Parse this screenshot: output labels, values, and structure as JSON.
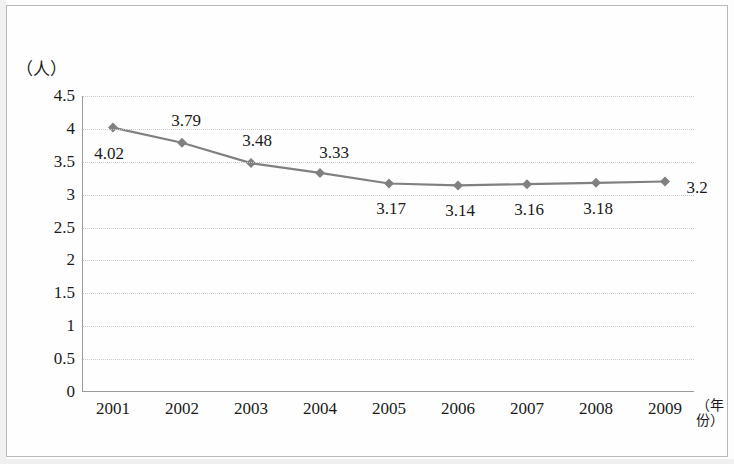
{
  "figure": {
    "unit_label": "（人）",
    "x_axis_title": "（年份）"
  },
  "chart_data": {
    "type": "line",
    "title": "",
    "subtitle": "",
    "xlabel": "（年份）",
    "ylabel": "（人）",
    "categories": [
      "2001",
      "2002",
      "2003",
      "2004",
      "2005",
      "2006",
      "2007",
      "2008",
      "2009"
    ],
    "values": [
      4.02,
      3.79,
      3.48,
      3.33,
      3.17,
      3.14,
      3.16,
      3.18,
      3.2
    ],
    "point_labels": [
      "4.02",
      "3.79",
      "3.48",
      "3.33",
      "3.17",
      "3.14",
      "3.16",
      "3.18",
      "3.2"
    ],
    "ylim": [
      0,
      4.5
    ],
    "yticks": [
      "0",
      "0.5",
      "1",
      "1.5",
      "2",
      "2.5",
      "3",
      "3.5",
      "4",
      "4.5"
    ],
    "ytick_values": [
      0,
      0.5,
      1,
      1.5,
      2,
      2.5,
      3,
      3.5,
      4,
      4.5
    ],
    "grid": true,
    "legend": [],
    "series_color": "#808080",
    "marker": "diamond",
    "marker_color": "#808080"
  }
}
